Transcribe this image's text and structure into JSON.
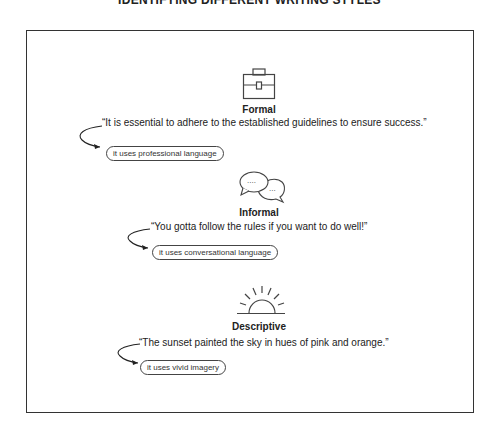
{
  "title": "IDENTIFYING DIFFERENT WRITING STYLES",
  "styles": [
    {
      "icon": "briefcase-icon",
      "heading": "Formal",
      "quote": "“It is essential to adhere to the established guidelines to ensure success.”",
      "note": "it uses professional language"
    },
    {
      "icon": "speech-bubbles-icon",
      "heading": "Informal",
      "quote": "“You gotta follow the rules if you want to do well!”",
      "note": "it uses conversational language"
    },
    {
      "icon": "sunset-icon",
      "heading": "Descriptive",
      "quote": "“The sunset painted the sky in hues of pink and orange.”",
      "note": "it uses vivid imagery"
    }
  ]
}
